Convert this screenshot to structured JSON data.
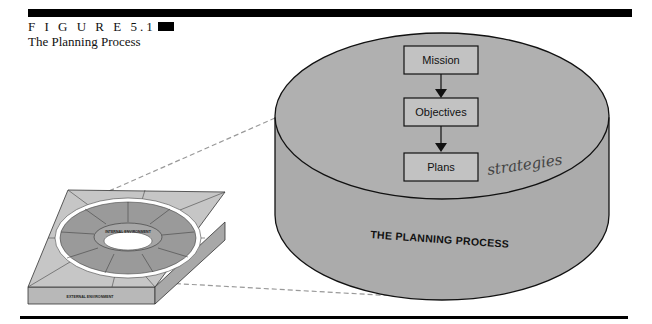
{
  "figure": {
    "label": "F I G U R E  5.1",
    "title": "The Planning Process"
  },
  "cylinder": {
    "title": "THE PLANNING PROCESS",
    "fill_color": "#a9a9a9",
    "flow": [
      {
        "label": "Mission"
      },
      {
        "label": "Objectives"
      },
      {
        "label": "Plans"
      }
    ],
    "annotation": "strategies"
  },
  "environment_block": {
    "inner_label": "INTERNAL ENVIRONMENT",
    "outer_label": "EXTERNAL ENVIRONMENT"
  }
}
